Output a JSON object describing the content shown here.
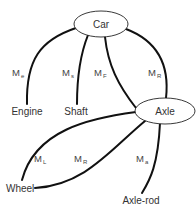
{
  "diagram": {
    "nodes": [
      {
        "id": "car",
        "label": "Car",
        "shape": "ellipse"
      },
      {
        "id": "axle",
        "label": "Axle",
        "shape": "ellipse"
      },
      {
        "id": "engine",
        "label": "Engine",
        "shape": "text"
      },
      {
        "id": "shaft",
        "label": "Shaft",
        "shape": "text"
      },
      {
        "id": "wheel",
        "label": "Wheel",
        "shape": "text"
      },
      {
        "id": "axle_rod",
        "label": "Axle-rod",
        "shape": "text"
      }
    ],
    "edges": [
      {
        "from": "car",
        "to": "engine",
        "label": "M",
        "sub": "e"
      },
      {
        "from": "car",
        "to": "shaft",
        "label": "M",
        "sub": "s"
      },
      {
        "from": "car",
        "to": "axle",
        "label": "M",
        "sub": "F"
      },
      {
        "from": "car",
        "to": "axle",
        "label": "M",
        "sub": "R"
      },
      {
        "from": "axle",
        "to": "wheel",
        "label": "M",
        "sub": "L"
      },
      {
        "from": "axle",
        "to": "wheel",
        "label": "M",
        "sub": "R"
      },
      {
        "from": "axle",
        "to": "axle_rod",
        "label": "M",
        "sub": "a"
      }
    ],
    "colors": {
      "line": "#111111",
      "text": "#333333",
      "background": "#ffffff"
    }
  }
}
